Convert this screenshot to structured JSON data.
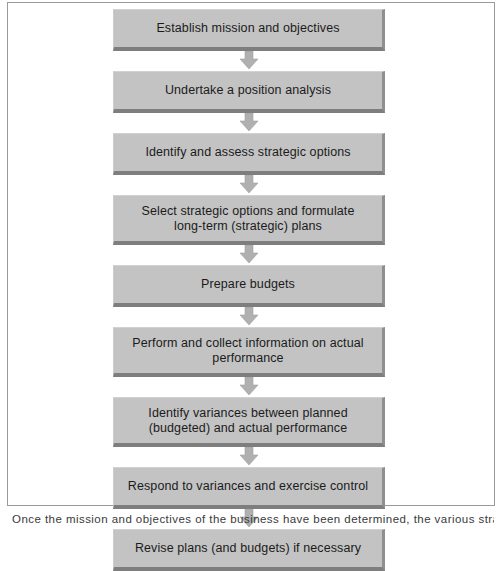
{
  "figure": {
    "type": "vertical-flowchart",
    "title": "",
    "frame_color": "#9a9a9a",
    "background_color": "#ffffff",
    "node_face_color": "#c3c3c3",
    "node_shadow_color": "#7e7e7e",
    "arrow_color": "#b0b0b0",
    "text_color": "#1b1b1b",
    "nodes": [
      {
        "id": "node-1",
        "label": "Establish mission and objectives",
        "lines": 1
      },
      {
        "id": "node-2",
        "label": "Undertake a position analysis",
        "lines": 1
      },
      {
        "id": "node-3",
        "label": "Identify and assess strategic options",
        "lines": 1
      },
      {
        "id": "node-4",
        "label": "Select strategic options and formulate\nlong-term (strategic) plans",
        "lines": 2
      },
      {
        "id": "node-5",
        "label": "Prepare budgets",
        "lines": 1
      },
      {
        "id": "node-6",
        "label": "Perform and collect information on actual\nperformance",
        "lines": 2
      },
      {
        "id": "node-7",
        "label": "Identify variances between planned\n(budgeted) and actual performance",
        "lines": 2
      },
      {
        "id": "node-8",
        "label": "Respond to variances and exercise control",
        "lines": 1
      },
      {
        "id": "node-9",
        "label": "Revise plans (and budgets) if necessary",
        "lines": 1
      }
    ],
    "connectors": [
      {
        "id": "arrow-1",
        "from": "node-1",
        "to": "node-2",
        "icon": "down-block-arrow-icon"
      },
      {
        "id": "arrow-2",
        "from": "node-2",
        "to": "node-3",
        "icon": "down-block-arrow-icon"
      },
      {
        "id": "arrow-3",
        "from": "node-3",
        "to": "node-4",
        "icon": "down-block-arrow-icon"
      },
      {
        "id": "arrow-4",
        "from": "node-4",
        "to": "node-5",
        "icon": "down-block-arrow-icon"
      },
      {
        "id": "arrow-5",
        "from": "node-5",
        "to": "node-6",
        "icon": "down-block-arrow-icon"
      },
      {
        "id": "arrow-6",
        "from": "node-6",
        "to": "node-7",
        "icon": "down-block-arrow-icon"
      },
      {
        "id": "arrow-7",
        "from": "node-7",
        "to": "node-8",
        "icon": "down-block-arrow-icon"
      },
      {
        "id": "arrow-8",
        "from": "node-8",
        "to": "node-9",
        "icon": "down-block-arrow-icon"
      }
    ]
  },
  "caption": {
    "text": "Once the mission and objectives of the business have been determined, the various strategic"
  }
}
